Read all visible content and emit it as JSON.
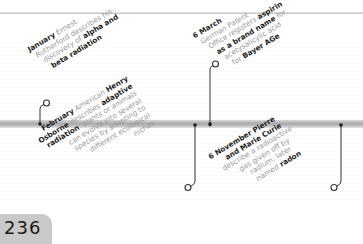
{
  "page": {
    "number": "236"
  },
  "timeline": {
    "entries": [
      {
        "id": "january",
        "position": "above",
        "lines": [
          {
            "parts": [
              {
                "t": "January",
                "b": true
              },
              {
                "t": " Ernest",
                "b": false
              }
            ]
          },
          {
            "parts": [
              {
                "t": "Rutherford describes his",
                "b": false
              }
            ]
          },
          {
            "parts": [
              {
                "t": "discovery of ",
                "b": false
              },
              {
                "t": "alpha and",
                "b": true
              }
            ]
          },
          {
            "parts": [
              {
                "t": "beta radiation",
                "b": true
              }
            ]
          }
        ]
      },
      {
        "id": "february",
        "position": "below",
        "lines": [
          {
            "parts": [
              {
                "t": "February",
                "b": true
              },
              {
                "t": " American ",
                "b": false
              },
              {
                "t": "Henry",
                "b": true
              }
            ]
          },
          {
            "parts": [
              {
                "t": "Osborne",
                "b": true
              },
              {
                "t": " describes ",
                "b": false
              },
              {
                "t": "adaptive",
                "b": true
              }
            ]
          },
          {
            "parts": [
              {
                "t": "radiation",
                "b": true
              },
              {
                "t": ": plants or animals",
                "b": false
              }
            ]
          },
          {
            "parts": [
              {
                "t": "can evolve into several",
                "b": false
              }
            ]
          },
          {
            "parts": [
              {
                "t": "species by adapting to",
                "b": false
              }
            ]
          },
          {
            "parts": [
              {
                "t": "different ecological",
                "b": false
              }
            ]
          },
          {
            "parts": [
              {
                "t": "niches",
                "b": false
              }
            ]
          }
        ]
      },
      {
        "id": "march",
        "position": "above",
        "lines": [
          {
            "parts": [
              {
                "t": "6 March",
                "b": true
              }
            ]
          },
          {
            "parts": [
              {
                "t": "German Patent",
                "b": false
              }
            ]
          },
          {
            "parts": [
              {
                "t": "Office registers ",
                "b": false
              },
              {
                "t": "aspirin",
                "b": true
              }
            ]
          },
          {
            "parts": [
              {
                "t": "as a brand name",
                "b": true
              },
              {
                "t": " for",
                "b": false
              }
            ]
          },
          {
            "parts": [
              {
                "t": "acetysalicylic acid",
                "b": false
              }
            ]
          },
          {
            "parts": [
              {
                "t": "for ",
                "b": false
              },
              {
                "t": "Bayer AGe",
                "b": true
              }
            ]
          }
        ]
      },
      {
        "id": "november",
        "position": "below",
        "lines": [
          {
            "parts": [
              {
                "t": "6 November Pierre",
                "b": true
              }
            ]
          },
          {
            "parts": [
              {
                "t": "and Marie Curie",
                "b": true
              }
            ]
          },
          {
            "parts": [
              {
                "t": "describe a radioactive",
                "b": false
              }
            ]
          },
          {
            "parts": [
              {
                "t": "gas given off by",
                "b": false
              }
            ]
          },
          {
            "parts": [
              {
                "t": "radium, later",
                "b": false
              }
            ]
          },
          {
            "parts": [
              {
                "t": "named ",
                "b": false
              },
              {
                "t": "radon",
                "b": true
              }
            ]
          }
        ]
      }
    ]
  },
  "colors": {
    "text_bold": "#1e1e1e",
    "text_regular": "#9a9a9a",
    "connector": "#333333",
    "page_tab": "#c9c9c9"
  }
}
